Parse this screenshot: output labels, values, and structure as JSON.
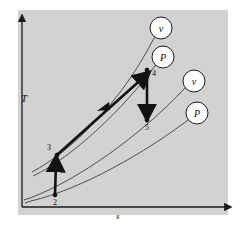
{
  "figure": {
    "type": "thermodynamic-Ts-diagram",
    "background_color": "#d2d2d2",
    "page_color": "#ffffff",
    "line_color": "#1a1a1a",
    "axes": {
      "y_label": "T",
      "x_label": "s",
      "y_axis_name": "temperature-axis",
      "x_axis_name": "entropy-axis"
    },
    "state_points": [
      {
        "id": "2",
        "label": "2",
        "x": 55,
        "y": 195
      },
      {
        "id": "3",
        "label": "3",
        "x": 57,
        "y": 155
      },
      {
        "id": "4",
        "label": "4",
        "x": 147,
        "y": 70
      },
      {
        "id": "5",
        "label": "5",
        "x": 147,
        "y": 120
      }
    ],
    "processes": [
      {
        "name": "process-2-to-3",
        "from": "2",
        "to": "3",
        "style": "thick",
        "arrow": "up"
      },
      {
        "name": "process-3-to-4",
        "from": "3",
        "to": "4",
        "style": "thick",
        "arrow": "up-right"
      },
      {
        "name": "process-4-to-5",
        "from": "4",
        "to": "5",
        "style": "thick",
        "arrow": "down"
      }
    ],
    "callouts": [
      {
        "id": "callout-v-top",
        "label": "v",
        "cx": 161,
        "cy": 28,
        "r": 11,
        "anchor_x": 147,
        "anchor_y": 70
      },
      {
        "id": "callout-P-top",
        "label": "P",
        "cx": 163,
        "cy": 57,
        "r": 11,
        "anchor_x": 147,
        "anchor_y": 70
      },
      {
        "id": "callout-v-right",
        "label": "v",
        "cx": 194,
        "cy": 81,
        "r": 11,
        "anchor_x": 147,
        "anchor_y": 120
      },
      {
        "id": "callout-P-right",
        "label": "P",
        "cx": 197,
        "cy": 113,
        "r": 11,
        "anchor_x": 147,
        "anchor_y": 120
      }
    ],
    "constant_lines": [
      {
        "name": "constant-volume-line-upper",
        "through": [
          "3",
          "4"
        ],
        "label": "v"
      },
      {
        "name": "constant-pressure-line-upper",
        "through": [
          "3",
          "4"
        ],
        "label": "P"
      },
      {
        "name": "constant-volume-line-lower",
        "through": [
          "2",
          "5"
        ],
        "label": "v"
      },
      {
        "name": "constant-pressure-line-lower",
        "through": [
          "2",
          "5"
        ],
        "label": "P"
      }
    ]
  }
}
